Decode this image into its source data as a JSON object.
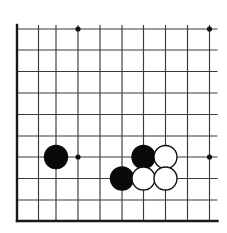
{
  "figure": {
    "kind": "go-board-diagram",
    "width": 227,
    "height": 233
  },
  "board": {
    "background_color": "#ffffff",
    "line_color": "#3a3a3a",
    "border_color": "#1a1a1a",
    "line_width": 1.15,
    "border_width": 2.4,
    "cropped_edges": [
      "top",
      "right"
    ],
    "solid_edges": [
      "left",
      "bottom"
    ],
    "columns": 10,
    "rows": 10,
    "vertical_lines_x": [
      17,
      38.5,
      56,
      78,
      100,
      122,
      143.5,
      165.5,
      187.5,
      209.5
    ],
    "horizontal_lines_y": [
      29,
      50,
      71.5,
      93,
      114.5,
      136,
      157,
      178.5,
      200,
      221
    ],
    "horizontal_overhang_right": 8,
    "bleed_top": 4
  },
  "star_points": {
    "label": "hoshi",
    "radius": 2.6,
    "color": "#101010",
    "points": [
      {
        "name": "star-point-top-left",
        "x": 78,
        "y": 29
      },
      {
        "name": "star-point-top-right",
        "x": 209.5,
        "y": 29
      },
      {
        "name": "star-point-bottom-left",
        "x": 78,
        "y": 157
      },
      {
        "name": "star-point-bottom-right",
        "x": 209.5,
        "y": 157
      }
    ]
  },
  "stones": {
    "radius": 11.5,
    "black_fill": "#0a0a0a",
    "white_fill": "#ffffff",
    "white_outline": "#101010",
    "items": [
      {
        "name": "stone-black-1",
        "color": "black",
        "x": 56,
        "y": 157
      },
      {
        "name": "stone-black-2",
        "color": "black",
        "x": 143.5,
        "y": 157
      },
      {
        "name": "stone-white-1",
        "color": "white",
        "x": 165.5,
        "y": 157
      },
      {
        "name": "stone-black-3",
        "color": "black",
        "x": 122,
        "y": 178.5
      },
      {
        "name": "stone-white-2",
        "color": "white",
        "x": 143.5,
        "y": 178.5
      },
      {
        "name": "stone-white-3",
        "color": "white",
        "x": 165.5,
        "y": 178.5
      }
    ],
    "counts": {
      "black": 3,
      "white": 3,
      "total": 6
    }
  }
}
